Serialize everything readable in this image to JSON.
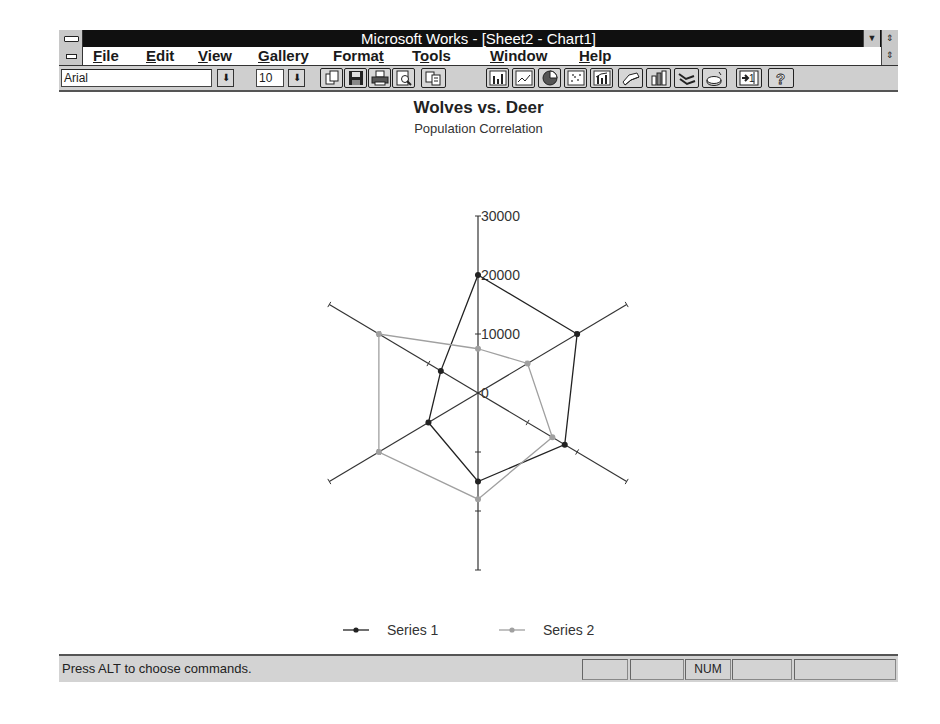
{
  "window": {
    "title": "Microsoft Works - [Sheet2 - Chart1]",
    "minimize_glyph": "▼",
    "restore_glyph": "⇕"
  },
  "menu": {
    "items": [
      {
        "label": "File",
        "accel": "F",
        "rest": "ile"
      },
      {
        "label": "Edit",
        "accel": "E",
        "rest": "dit"
      },
      {
        "label": "View",
        "accel": "V",
        "rest": "iew"
      },
      {
        "label": "Gallery",
        "accel": "G",
        "rest": "allery"
      },
      {
        "label": "Format",
        "pre": "Forma",
        "accel": "t",
        "rest": ""
      },
      {
        "label": "Tools",
        "pre": "T",
        "accel": "o",
        "rest": "ols"
      },
      {
        "label": "Window",
        "accel": "W",
        "rest": "indow"
      },
      {
        "label": "Help",
        "accel": "H",
        "rest": "elp"
      }
    ]
  },
  "toolbar": {
    "font_name": "Arial",
    "font_size": "10",
    "dropdown_glyph": "⬇",
    "buttons": [
      {
        "name": "new-chart",
        "icon": "new-icon"
      },
      {
        "name": "save",
        "icon": "save-icon"
      },
      {
        "name": "print",
        "icon": "print-icon"
      },
      {
        "name": "print-preview",
        "icon": "preview-icon"
      },
      {
        "name": "copy",
        "icon": "copy-icon"
      },
      {
        "name": "bar-chart",
        "icon": "bar-chart-icon"
      },
      {
        "name": "line-chart",
        "icon": "line-chart-icon"
      },
      {
        "name": "pie-chart",
        "icon": "pie-chart-icon"
      },
      {
        "name": "scatter-chart",
        "icon": "scatter-chart-icon"
      },
      {
        "name": "combination-chart",
        "icon": "combination-chart-icon"
      },
      {
        "name": "3d-area-chart",
        "icon": "3d-area-chart-icon"
      },
      {
        "name": "3d-bar-chart",
        "icon": "3d-bar-chart-icon"
      },
      {
        "name": "3d-line-chart",
        "icon": "3d-line-chart-icon"
      },
      {
        "name": "3d-pie-chart",
        "icon": "3d-pie-chart-icon"
      },
      {
        "name": "go-to-sheet",
        "icon": "go-to-sheet-icon"
      },
      {
        "name": "help",
        "icon": "help-icon"
      }
    ]
  },
  "chart_data": {
    "type": "radar",
    "title": "Wolves vs. Deer",
    "subtitle": "Population Correlation",
    "axes_count": 6,
    "rlim": [
      0,
      30000
    ],
    "r_ticks": [
      "0",
      "10000",
      "20000",
      "30000"
    ],
    "grid": false,
    "legend_position": "bottom",
    "series": [
      {
        "name": "Series 1",
        "color": "#222222",
        "values": [
          20000,
          20000,
          17500,
          15000,
          10000,
          7500
        ]
      },
      {
        "name": "Series 2",
        "color": "#a0a0a0",
        "values": [
          7500,
          10000,
          15000,
          18000,
          20000,
          20000
        ]
      }
    ]
  },
  "status": {
    "message": "Press ALT to choose commands.",
    "panels": [
      "",
      "",
      "NUM",
      "",
      ""
    ]
  }
}
